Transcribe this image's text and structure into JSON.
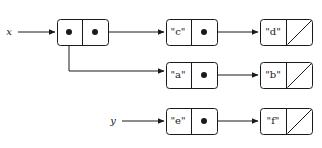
{
  "diagram": {
    "kind": "cons-cell-linked-list",
    "canvas": {
      "width": 322,
      "height": 148,
      "background": "#ffffff"
    },
    "ink_color": "#1a1a1a",
    "variables": [
      {
        "id": "var-x",
        "label": "x",
        "x": 9,
        "y": 32,
        "arrow_from_x": 18,
        "arrow_to_x": 57,
        "arrow_y": 32
      },
      {
        "id": "var-y",
        "label": "y",
        "x": 113,
        "y": 121,
        "arrow_from_x": 122,
        "arrow_to_x": 166,
        "arrow_y": 121
      }
    ],
    "cells": [
      {
        "id": "cell-root",
        "row": "top",
        "x": 57,
        "y": 19,
        "width": 51,
        "height": 26,
        "divider_x": 82,
        "left": {
          "type": "pointer-dot",
          "label": "",
          "cx": 69,
          "cy": 32
        },
        "right": {
          "type": "pointer-dot",
          "label": "",
          "cx": 95,
          "cy": 32
        }
      },
      {
        "id": "cell-c",
        "row": "top",
        "x": 166,
        "y": 19,
        "width": 51,
        "height": 26,
        "divider_x": 191,
        "left": {
          "type": "value",
          "label": "\"c\"",
          "cx": 178,
          "cy": 32
        },
        "right": {
          "type": "pointer-dot",
          "label": "",
          "cx": 204,
          "cy": 32
        }
      },
      {
        "id": "cell-d",
        "row": "top",
        "x": 260,
        "y": 19,
        "width": 52,
        "height": 26,
        "divider_x": 286,
        "left": {
          "type": "value",
          "label": "\"d\"",
          "cx": 273,
          "cy": 32
        },
        "right": {
          "type": "nil-slash",
          "label": "",
          "cx": 299,
          "cy": 32
        }
      },
      {
        "id": "cell-a",
        "row": "middle",
        "x": 166,
        "y": 62,
        "width": 51,
        "height": 26,
        "divider_x": 191,
        "left": {
          "type": "value",
          "label": "\"a\"",
          "cx": 178,
          "cy": 75
        },
        "right": {
          "type": "pointer-dot",
          "label": "",
          "cx": 204,
          "cy": 75
        }
      },
      {
        "id": "cell-b",
        "row": "middle",
        "x": 260,
        "y": 62,
        "width": 52,
        "height": 26,
        "divider_x": 286,
        "left": {
          "type": "value",
          "label": "\"b\"",
          "cx": 273,
          "cy": 75
        },
        "right": {
          "type": "nil-slash",
          "label": "",
          "cx": 299,
          "cy": 75
        }
      },
      {
        "id": "cell-e",
        "row": "bottom",
        "x": 166,
        "y": 108,
        "width": 51,
        "height": 26,
        "divider_x": 191,
        "left": {
          "type": "value",
          "label": "\"e\"",
          "cx": 178,
          "cy": 121
        },
        "right": {
          "type": "pointer-dot",
          "label": "",
          "cx": 204,
          "cy": 121
        }
      },
      {
        "id": "cell-f",
        "row": "bottom",
        "x": 260,
        "y": 108,
        "width": 52,
        "height": 26,
        "divider_x": 286,
        "left": {
          "type": "value",
          "label": "\"f\"",
          "cx": 273,
          "cy": 121
        },
        "right": {
          "type": "nil-slash",
          "label": "",
          "cx": 299,
          "cy": 121
        }
      }
    ],
    "links": [
      {
        "id": "link-x-to-root",
        "from": "var-x",
        "to": "cell-root",
        "path": "M 18 32 L 55 32"
      },
      {
        "id": "link-root-cdr-to-c",
        "from": "cell-root.right",
        "to": "cell-c",
        "path": "M 95 32 L 164 32"
      },
      {
        "id": "link-root-car-to-a",
        "from": "cell-root.left",
        "to": "cell-a",
        "path": "M 69 32 L 69 71 L 164 71"
      },
      {
        "id": "link-c-cdr-to-d",
        "from": "cell-c.right",
        "to": "cell-d",
        "path": "M 204 32 L 258 32"
      },
      {
        "id": "link-a-cdr-to-b",
        "from": "cell-a.right",
        "to": "cell-b",
        "path": "M 204 75 L 258 75"
      },
      {
        "id": "link-y-to-e",
        "from": "var-y",
        "to": "cell-e",
        "path": "M 122 121 L 164 121"
      },
      {
        "id": "link-e-cdr-to-f",
        "from": "cell-e.right",
        "to": "cell-f",
        "path": "M 204 121 L 258 121"
      }
    ],
    "legend": {
      "dot_meaning": "pointer",
      "slash_meaning": "nil / empty list"
    }
  }
}
